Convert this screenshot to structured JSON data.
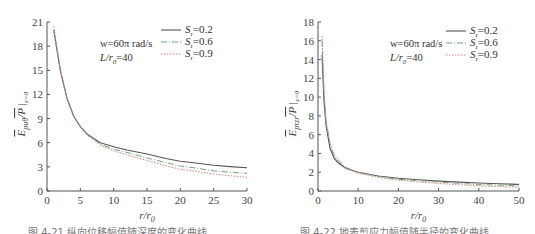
{
  "chart_data": [
    {
      "type": "line",
      "title": "",
      "xlabel": "r/r0",
      "ylabel": "Ep·uθ / P |z=0",
      "xlim": [
        0,
        30
      ],
      "ylim": [
        0,
        21
      ],
      "xticks": [
        0,
        5,
        10,
        15,
        20,
        25,
        30
      ],
      "yticks": [
        0,
        3,
        6,
        9,
        12,
        15,
        18,
        21
      ],
      "grid": false,
      "legend_position": "upper right",
      "annotations": [
        "w=60π rad/s",
        "L/r0=40"
      ],
      "x": [
        1,
        2,
        3,
        4,
        5,
        6,
        8,
        10,
        12,
        15,
        18,
        20,
        22,
        25,
        28,
        30
      ],
      "series": [
        {
          "name": "Sr=0.2",
          "style": "solid",
          "color": "#555555",
          "values": [
            20.0,
            15.0,
            11.5,
            9.3,
            8.0,
            7.1,
            6.0,
            5.5,
            5.1,
            4.6,
            4.0,
            3.7,
            3.5,
            3.2,
            3.0,
            2.9
          ]
        },
        {
          "name": "Sr=0.6",
          "style": "dashdot",
          "color": "#7aa07a",
          "values": [
            20.0,
            15.0,
            11.5,
            9.3,
            8.0,
            7.0,
            5.8,
            5.2,
            4.8,
            4.1,
            3.5,
            3.1,
            2.9,
            2.5,
            2.3,
            2.2
          ]
        },
        {
          "name": "Sr=0.9",
          "style": "dotted",
          "color": "#d08080",
          "values": [
            20.5,
            15.2,
            11.6,
            9.3,
            8.0,
            7.0,
            5.7,
            5.0,
            4.5,
            3.8,
            3.1,
            2.7,
            2.5,
            2.1,
            1.85,
            1.7
          ]
        }
      ]
    },
    {
      "type": "line",
      "title": "",
      "xlabel": "r/r0",
      "ylabel": "Ep·τzr / P |z=0",
      "xlim": [
        0,
        50
      ],
      "ylim": [
        0,
        18
      ],
      "xticks": [
        0,
        10,
        20,
        30,
        40,
        50
      ],
      "yticks": [
        0,
        2,
        4,
        6,
        8,
        10,
        12,
        14,
        16,
        18
      ],
      "grid": false,
      "legend_position": "upper right",
      "annotations": [
        "w=60π rad/s",
        "L/r0=40"
      ],
      "x": [
        1,
        1.5,
        2,
        3,
        4,
        5,
        7,
        10,
        15,
        20,
        25,
        30,
        35,
        40,
        45,
        50
      ],
      "series": [
        {
          "name": "Sr=0.2",
          "style": "solid",
          "color": "#555555",
          "values": [
            14.5,
            9.5,
            7.0,
            4.5,
            3.5,
            3.0,
            2.4,
            2.0,
            1.6,
            1.35,
            1.2,
            1.05,
            0.95,
            0.85,
            0.78,
            0.7
          ]
        },
        {
          "name": "Sr=0.6",
          "style": "dashdot",
          "color": "#7aa07a",
          "values": [
            16.0,
            10.5,
            7.5,
            5.0,
            3.8,
            3.3,
            2.5,
            2.0,
            1.55,
            1.25,
            1.1,
            0.95,
            0.82,
            0.7,
            0.62,
            0.55
          ]
        },
        {
          "name": "Sr=0.9",
          "style": "dotted",
          "color": "#d08080",
          "values": [
            16.5,
            10.8,
            7.5,
            5.0,
            3.8,
            3.2,
            2.4,
            1.9,
            1.45,
            1.15,
            0.97,
            0.8,
            0.67,
            0.55,
            0.47,
            0.4
          ]
        }
      ]
    }
  ],
  "charts": [
    {
      "ylabel_main": "E",
      "ylabel_sub": "pu",
      "ylabel_theta": "θ",
      "ylabel_tail": "/P",
      "ylabel_cond": "z=0",
      "xlabel_r": "r/r",
      "xlabel_sub": "0",
      "ann1": "w=60π rad/s",
      "ann2_pre": "L/r",
      "ann2_sub": "0",
      "ann2_post": "=40",
      "legend": [
        {
          "s": "S",
          "sub": "r",
          "val": "=0.2"
        },
        {
          "s": "S",
          "sub": "r",
          "val": "=0.6"
        },
        {
          "s": "S",
          "sub": "r",
          "val": "=0.9"
        }
      ],
      "caption": "图 4-21  纵向位移幅值随深度的变化曲线"
    },
    {
      "ylabel_main": "E",
      "ylabel_sub": "pτ",
      "ylabel_theta": "zr",
      "ylabel_tail": "/P",
      "ylabel_cond": "z=0",
      "xlabel_r": "r/r",
      "xlabel_sub": "0",
      "ann1": "w=60π rad/s",
      "ann2_pre": "L/r",
      "ann2_sub": "0",
      "ann2_post": "=40",
      "legend": [
        {
          "s": "S",
          "sub": "r",
          "val": "=0.2"
        },
        {
          "s": "S",
          "sub": "r",
          "val": "=0.6"
        },
        {
          "s": "S",
          "sub": "r",
          "val": "=0.9"
        }
      ],
      "caption": "图 4-22  地表剪应力幅值随半径的变化曲线"
    }
  ]
}
